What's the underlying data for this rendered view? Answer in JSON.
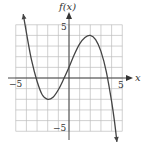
{
  "chart_data": {
    "type": "line",
    "title": "",
    "xlabel": "x",
    "ylabel": "f(x)",
    "xlim": [
      -5,
      5
    ],
    "ylim": [
      -5,
      5
    ],
    "grid": true,
    "grid_step": 1,
    "tick_labels": {
      "x": [
        {
          "value": -5,
          "label": "−5"
        },
        {
          "value": 5,
          "label": "5"
        }
      ],
      "y": [
        {
          "value": 5,
          "label": "5"
        },
        {
          "value": -5,
          "label": "−5"
        }
      ]
    },
    "series": [
      {
        "name": "f(x)",
        "description": "cubic-like curve with negative leading coefficient; arrows at both ends",
        "x": [
          -4.3,
          -3.9,
          -3.5,
          -3.0,
          -2.5,
          -2.0,
          -1.5,
          -1.0,
          -0.5,
          0.0,
          0.5,
          1.0,
          1.5,
          2.0,
          2.5,
          3.0,
          3.5,
          4.0,
          4.3,
          4.5
        ],
        "y": [
          6.0,
          3.7,
          1.6,
          -0.3,
          -1.6,
          -2.0,
          -1.8,
          -1.1,
          -0.1,
          1.0,
          2.2,
          3.2,
          3.8,
          4.0,
          3.6,
          2.5,
          0.6,
          -2.2,
          -4.3,
          -6.0
        ],
        "key_points": {
          "local_min": [
            -2,
            -2
          ],
          "local_max": [
            2,
            4
          ],
          "y_intercept": [
            0,
            1
          ],
          "x_intercepts": [
            -3,
            -0.5,
            3.6
          ]
        }
      }
    ]
  },
  "labels": {
    "y_axis": "f(x)",
    "x_axis": "x",
    "x_min": "−5",
    "x_max": "5",
    "y_max": "5",
    "y_min": "−5"
  }
}
